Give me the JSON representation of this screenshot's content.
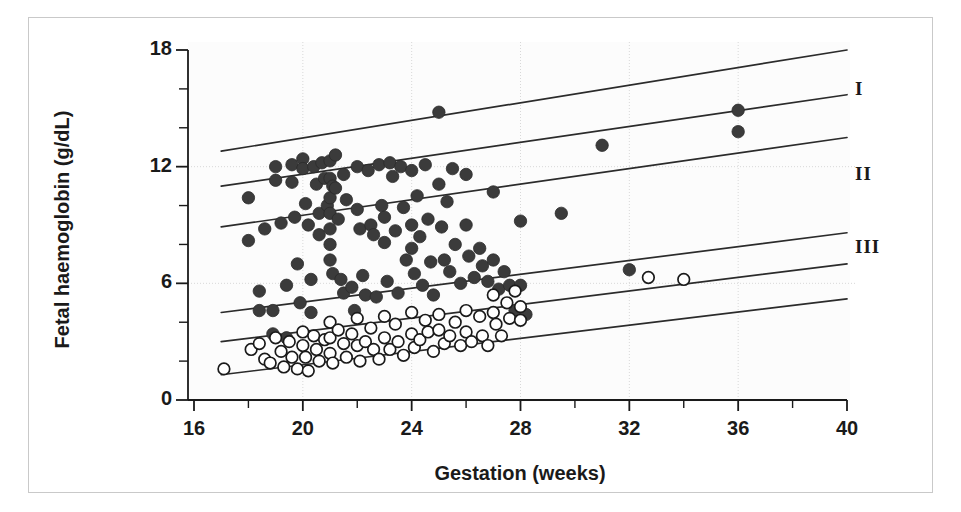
{
  "chart_data": {
    "type": "scatter",
    "title": "",
    "xlabel": "Gestation (weeks)",
    "ylabel": "Fetal haemoglobin (g/dL)",
    "xlim": [
      16,
      40
    ],
    "ylim": [
      0,
      18
    ],
    "xticks": [
      16,
      20,
      24,
      28,
      32,
      36,
      40
    ],
    "xtick_minor_step": 2,
    "yticks": [
      0,
      6,
      12,
      18
    ],
    "ytick_minor_step": 2,
    "grid": "light dotted gridlines at x=20,24,28,32,36 and y=6,12",
    "legend_position": "none",
    "band_labels": [
      {
        "label": "I",
        "x_px": 862,
        "y_px": 88
      },
      {
        "label": "II",
        "x_px": 862,
        "y_px": 172
      },
      {
        "label": "III",
        "x_px": 862,
        "y_px": 245
      }
    ],
    "reference_lines": [
      {
        "name": "line-1",
        "x0": 17.0,
        "y0": 12.8,
        "x1": 40.0,
        "y1": 18.0
      },
      {
        "name": "line-2",
        "x0": 17.0,
        "y0": 11.0,
        "x1": 40.0,
        "y1": 15.7
      },
      {
        "name": "line-3",
        "x0": 17.0,
        "y0": 8.9,
        "x1": 40.0,
        "y1": 13.5
      },
      {
        "name": "line-4",
        "x0": 17.0,
        "y0": 4.5,
        "x1": 40.0,
        "y1": 8.6
      },
      {
        "name": "line-5",
        "x0": 17.0,
        "y0": 3.0,
        "x1": 40.0,
        "y1": 7.0
      },
      {
        "name": "line-6",
        "x0": 17.0,
        "y0": 1.3,
        "x1": 40.0,
        "y1": 5.2
      }
    ],
    "series": [
      {
        "name": "filled-circles",
        "marker": "filled-circle",
        "color": "#3b3b3b",
        "points": [
          [
            18.0,
            10.4
          ],
          [
            18.0,
            8.2
          ],
          [
            18.4,
            5.6
          ],
          [
            18.4,
            4.6
          ],
          [
            18.6,
            8.8
          ],
          [
            18.9,
            4.6
          ],
          [
            18.9,
            3.4
          ],
          [
            19.0,
            12.0
          ],
          [
            19.0,
            11.3
          ],
          [
            19.2,
            9.1
          ],
          [
            19.4,
            5.9
          ],
          [
            19.4,
            3.2
          ],
          [
            19.6,
            12.1
          ],
          [
            19.6,
            11.2
          ],
          [
            19.7,
            9.4
          ],
          [
            19.8,
            7.0
          ],
          [
            19.9,
            5.0
          ],
          [
            20.0,
            12.4
          ],
          [
            20.0,
            11.9
          ],
          [
            20.1,
            10.1
          ],
          [
            20.2,
            9.0
          ],
          [
            20.3,
            6.2
          ],
          [
            20.3,
            4.5
          ],
          [
            20.4,
            12.0
          ],
          [
            20.5,
            11.1
          ],
          [
            20.6,
            9.6
          ],
          [
            20.6,
            8.5
          ],
          [
            20.7,
            12.2
          ],
          [
            20.8,
            11.4
          ],
          [
            20.9,
            10.0
          ],
          [
            21.0,
            12.3
          ],
          [
            21.0,
            11.4
          ],
          [
            21.0,
            10.4
          ],
          [
            21.0,
            9.6
          ],
          [
            21.0,
            8.8
          ],
          [
            21.0,
            8.0
          ],
          [
            21.0,
            7.2
          ],
          [
            21.1,
            11.0
          ],
          [
            21.1,
            6.5
          ],
          [
            21.2,
            12.6
          ],
          [
            21.2,
            10.9
          ],
          [
            21.3,
            9.3
          ],
          [
            21.4,
            6.2
          ],
          [
            21.5,
            11.6
          ],
          [
            21.5,
            5.5
          ],
          [
            21.6,
            10.3
          ],
          [
            21.8,
            5.8
          ],
          [
            21.9,
            4.6
          ],
          [
            22.0,
            12.0
          ],
          [
            22.0,
            9.8
          ],
          [
            22.1,
            8.8
          ],
          [
            22.2,
            6.4
          ],
          [
            22.3,
            5.4
          ],
          [
            22.4,
            11.8
          ],
          [
            22.5,
            9.0
          ],
          [
            22.6,
            8.5
          ],
          [
            22.7,
            5.3
          ],
          [
            22.8,
            12.1
          ],
          [
            22.9,
            10.0
          ],
          [
            23.0,
            9.4
          ],
          [
            23.0,
            8.1
          ],
          [
            23.1,
            6.1
          ],
          [
            23.2,
            12.2
          ],
          [
            23.3,
            11.5
          ],
          [
            23.4,
            8.7
          ],
          [
            23.5,
            5.5
          ],
          [
            23.6,
            12.0
          ],
          [
            23.7,
            9.9
          ],
          [
            23.8,
            7.2
          ],
          [
            24.0,
            11.8
          ],
          [
            24.0,
            9.0
          ],
          [
            24.0,
            7.8
          ],
          [
            24.1,
            6.5
          ],
          [
            24.2,
            10.5
          ],
          [
            24.3,
            8.4
          ],
          [
            24.4,
            5.9
          ],
          [
            24.5,
            12.1
          ],
          [
            24.6,
            9.3
          ],
          [
            24.7,
            7.1
          ],
          [
            24.8,
            5.4
          ],
          [
            25.0,
            14.8
          ],
          [
            25.0,
            11.1
          ],
          [
            25.1,
            8.9
          ],
          [
            25.2,
            7.2
          ],
          [
            25.3,
            10.2
          ],
          [
            25.4,
            6.6
          ],
          [
            25.5,
            11.9
          ],
          [
            25.6,
            8.0
          ],
          [
            25.8,
            6.0
          ],
          [
            26.0,
            11.6
          ],
          [
            26.0,
            9.0
          ],
          [
            26.1,
            7.4
          ],
          [
            26.3,
            6.3
          ],
          [
            26.5,
            7.8
          ],
          [
            26.6,
            6.9
          ],
          [
            26.8,
            6.1
          ],
          [
            27.0,
            10.7
          ],
          [
            27.0,
            7.2
          ],
          [
            27.2,
            5.7
          ],
          [
            27.4,
            6.6
          ],
          [
            27.6,
            5.9
          ],
          [
            27.8,
            4.6
          ],
          [
            28.0,
            9.2
          ],
          [
            28.0,
            5.9
          ],
          [
            28.2,
            4.4
          ],
          [
            29.5,
            9.6
          ],
          [
            31.0,
            13.1
          ],
          [
            32.0,
            6.7
          ],
          [
            36.0,
            14.9
          ],
          [
            36.0,
            13.8
          ]
        ]
      },
      {
        "name": "open-circles",
        "marker": "open-circle",
        "color": "#1a1a1a",
        "points": [
          [
            17.1,
            1.6
          ],
          [
            18.1,
            2.6
          ],
          [
            18.4,
            2.9
          ],
          [
            18.6,
            2.1
          ],
          [
            18.8,
            1.9
          ],
          [
            19.0,
            3.2
          ],
          [
            19.2,
            2.5
          ],
          [
            19.3,
            1.7
          ],
          [
            19.5,
            3.0
          ],
          [
            19.6,
            2.2
          ],
          [
            19.8,
            1.6
          ],
          [
            20.0,
            3.5
          ],
          [
            20.0,
            2.8
          ],
          [
            20.1,
            2.2
          ],
          [
            20.2,
            1.5
          ],
          [
            20.4,
            3.3
          ],
          [
            20.5,
            2.6
          ],
          [
            20.6,
            2.0
          ],
          [
            20.8,
            3.1
          ],
          [
            21.0,
            4.0
          ],
          [
            21.0,
            3.2
          ],
          [
            21.0,
            2.4
          ],
          [
            21.1,
            1.9
          ],
          [
            21.3,
            3.6
          ],
          [
            21.5,
            2.9
          ],
          [
            21.6,
            2.2
          ],
          [
            21.8,
            3.4
          ],
          [
            22.0,
            4.2
          ],
          [
            22.0,
            2.8
          ],
          [
            22.1,
            2.0
          ],
          [
            22.3,
            3.0
          ],
          [
            22.5,
            3.7
          ],
          [
            22.6,
            2.6
          ],
          [
            22.8,
            2.1
          ],
          [
            23.0,
            4.3
          ],
          [
            23.0,
            3.2
          ],
          [
            23.2,
            2.6
          ],
          [
            23.4,
            3.9
          ],
          [
            23.5,
            3.0
          ],
          [
            23.7,
            2.3
          ],
          [
            24.0,
            4.5
          ],
          [
            24.0,
            3.4
          ],
          [
            24.1,
            2.7
          ],
          [
            24.3,
            3.1
          ],
          [
            24.5,
            4.1
          ],
          [
            24.6,
            3.5
          ],
          [
            24.8,
            2.5
          ],
          [
            25.0,
            4.4
          ],
          [
            25.0,
            3.6
          ],
          [
            25.2,
            2.9
          ],
          [
            25.4,
            3.3
          ],
          [
            25.6,
            4.0
          ],
          [
            25.8,
            2.8
          ],
          [
            26.0,
            4.6
          ],
          [
            26.0,
            3.5
          ],
          [
            26.2,
            3.0
          ],
          [
            26.5,
            4.3
          ],
          [
            26.6,
            3.3
          ],
          [
            26.8,
            2.8
          ],
          [
            27.0,
            5.4
          ],
          [
            27.0,
            4.5
          ],
          [
            27.1,
            3.9
          ],
          [
            27.3,
            3.3
          ],
          [
            27.5,
            5.0
          ],
          [
            27.6,
            4.2
          ],
          [
            27.8,
            5.6
          ],
          [
            28.0,
            4.8
          ],
          [
            28.0,
            4.1
          ],
          [
            32.7,
            6.3
          ],
          [
            34.0,
            6.2
          ]
        ]
      }
    ]
  },
  "axes": {
    "x_tick_labels": [
      "16",
      "20",
      "24",
      "28",
      "32",
      "36",
      "40"
    ],
    "y_tick_labels": [
      "18",
      "12",
      "6",
      "0"
    ],
    "x_title": "Gestation (weeks)",
    "y_title": "Fetal haemoglobin (g/dL)"
  },
  "band_labels": {
    "one": "I",
    "two": "II",
    "three": "III"
  },
  "colors": {
    "filled_marker": "#3b3b3b",
    "open_marker_stroke": "#1a1a1a",
    "line": "#2b2b2b",
    "axis": "#1a1a1a",
    "grid": "#d8d8d8",
    "frame": "#c9c9c9",
    "plot_background": "#fcfcfc"
  }
}
